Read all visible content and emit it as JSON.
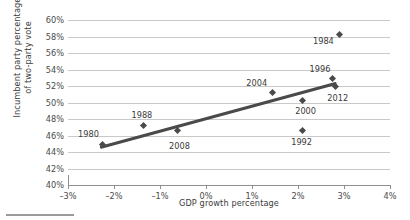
{
  "chart_data": {
    "type": "scatter",
    "title": "",
    "xlabel": "GDP growth percentage",
    "ylabel": "Incumbent party percentage\nof two-party vote",
    "xlim": [
      -3,
      4
    ],
    "ylim": [
      40,
      60
    ],
    "grid": true,
    "legend": "none",
    "xticks": [
      "–3%",
      "–2%",
      "–1%",
      "0%",
      "1%",
      "2%",
      "3%",
      "4%"
    ],
    "xtick_values": [
      -3,
      -2,
      -1,
      0,
      1,
      2,
      3,
      4
    ],
    "yticks": [
      "40%",
      "42%",
      "44%",
      "46%",
      "48%",
      "50%",
      "52%",
      "54%",
      "56%",
      "58%",
      "60%"
    ],
    "ytick_values": [
      40,
      42,
      44,
      46,
      48,
      50,
      52,
      54,
      56,
      58,
      60
    ],
    "points": [
      {
        "label": "1980",
        "x": -2.25,
        "y": 44.9,
        "label_dx": -14,
        "label_dy": -11
      },
      {
        "label": "1988",
        "x": -1.35,
        "y": 47.2,
        "label_dx": -2,
        "label_dy": -11
      },
      {
        "label": "2008",
        "x": -0.62,
        "y": 46.6,
        "label_dx": 2,
        "label_dy": 15
      },
      {
        "label": "1992",
        "x": 2.1,
        "y": 46.6,
        "label_dx": -1,
        "label_dy": 11
      },
      {
        "label": "2000",
        "x": 2.1,
        "y": 50.3,
        "label_dx": 3,
        "label_dy": 11
      },
      {
        "label": "2004",
        "x": 1.45,
        "y": 51.2,
        "label_dx": -16,
        "label_dy": -10
      },
      {
        "label": "2012",
        "x": 2.82,
        "y": 52.0,
        "label_dx": 2,
        "label_dy": 12
      },
      {
        "label": "1996",
        "x": 2.74,
        "y": 52.9,
        "label_dx": -12,
        "label_dy": -10
      },
      {
        "label": "1984",
        "x": 2.9,
        "y": 58.2,
        "label_dx": -16,
        "label_dy": 6
      }
    ],
    "trendline": {
      "x1": -2.3,
      "y1": 44.75,
      "x2": 2.85,
      "y2": 52.55
    }
  },
  "colors": {
    "point": "#4a4a4a",
    "trend": "#4a4a4a",
    "grid": "#c9c9c9",
    "axis": "#8f8f8f",
    "text": "#3b3b3b",
    "background": "#ffffff"
  }
}
